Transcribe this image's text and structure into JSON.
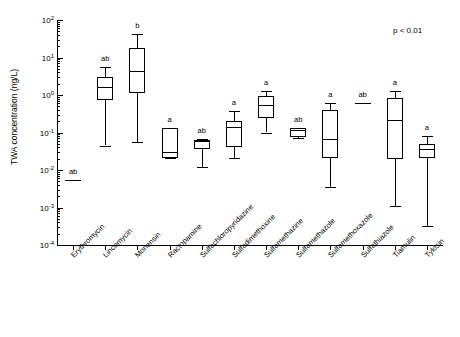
{
  "chart_data": {
    "type": "box",
    "title": "",
    "xlabel": "",
    "ylabel": "TWA concentration (ng/L)",
    "yscale": "log",
    "ylim": [
      0.0001,
      100
    ],
    "ytick_labels": [
      "10⁴",
      "10³",
      "10²",
      "10¹",
      "10⁰",
      "10⁻¹",
      "10⁻²",
      "10⁻³",
      "10⁻⁴"
    ],
    "grid": false,
    "legend": "none",
    "annotation": "p < 0.01",
    "categories": [
      "Erythromycin",
      "Lincomycin",
      "Monensin",
      "Ractopamine",
      "Sulfachloropyridazine",
      "Sulfadimethoxine",
      "Sulfamethazine",
      "Sulfamethazole",
      "Sulfamethoxazole",
      "Sulfathiazole",
      "Tiamulin",
      "Tylosin"
    ],
    "group_labels": [
      "ab",
      "ab",
      "b",
      "a",
      "ab",
      "a",
      "a",
      "ab",
      "a",
      "ab",
      "a",
      "a"
    ],
    "boxes": [
      {
        "category": "Erythromycin",
        "single_value": 0.0055,
        "whisker_low": null,
        "q1": null,
        "median": 0.0055,
        "q3": null,
        "whisker_high": null
      },
      {
        "category": "Lincomycin",
        "whisker_low": 0.045,
        "q1": 0.75,
        "median": 1.6,
        "q3": 3.0,
        "whisker_high": 5.5
      },
      {
        "category": "Monensin",
        "whisker_low": 0.055,
        "q1": 1.1,
        "median": 4.3,
        "q3": 18.0,
        "whisker_high": 42.0
      },
      {
        "category": "Ractopamine",
        "whisker_low": 0.021,
        "q1": 0.021,
        "median": 0.031,
        "q3": 0.13,
        "whisker_high": 0.13
      },
      {
        "category": "Sulfachloropyridazine",
        "whisker_low": 0.012,
        "q1": 0.036,
        "median": 0.058,
        "q3": 0.065,
        "whisker_high": 0.066
      },
      {
        "category": "Sulfadimethoxine",
        "whisker_low": 0.021,
        "q1": 0.04,
        "median": 0.14,
        "q3": 0.2,
        "whisker_high": 0.37
      },
      {
        "category": "Sulfamethazine",
        "whisker_low": 0.1,
        "q1": 0.24,
        "median": 0.53,
        "q3": 0.95,
        "whisker_high": 1.25
      },
      {
        "category": "Sulfamethazole",
        "whisker_low": 0.07,
        "q1": 0.075,
        "median": 0.12,
        "q3": 0.13,
        "whisker_high": 0.13
      },
      {
        "category": "Sulfamethoxazole",
        "whisker_low": 0.0035,
        "q1": 0.021,
        "median": 0.066,
        "q3": 0.4,
        "whisker_high": 0.6
      },
      {
        "category": "Sulfathiazole",
        "single_value": 0.6,
        "whisker_low": null,
        "q1": null,
        "median": 0.6,
        "q3": null,
        "whisker_high": null
      },
      {
        "category": "Tiamulin",
        "whisker_low": 0.0011,
        "q1": 0.02,
        "median": 0.21,
        "q3": 0.85,
        "whisker_high": 1.3
      },
      {
        "category": "Tylosin",
        "whisker_low": 0.00033,
        "q1": 0.021,
        "median": 0.036,
        "q3": 0.05,
        "whisker_high": 0.08
      }
    ]
  }
}
